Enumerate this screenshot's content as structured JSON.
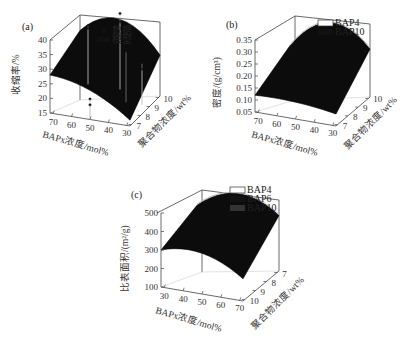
{
  "chart_data": [
    {
      "panel": "(a)",
      "type": "surface3d",
      "zlabel": "收缩率/%",
      "xlabel": "BAPx浓度/mol%",
      "ylabel": "聚合物浓度/wt%",
      "x_ticks": [
        "70",
        "60",
        "50",
        "40",
        "30"
      ],
      "y_ticks": [
        "7",
        "8",
        "9",
        "10"
      ],
      "z_ticks": [
        "15",
        "20",
        "25",
        "30",
        "35",
        "40"
      ],
      "xlim": [
        25,
        75
      ],
      "ylim": [
        7,
        10
      ],
      "zlim": [
        15,
        40
      ],
      "legend": [
        {
          "name": "数据",
          "style": "point"
        },
        {
          "name": "模型",
          "style": "surface"
        }
      ],
      "surface_corners": {
        "x70_y10": 33,
        "x50_y10": 39,
        "x30_y10": 29,
        "x70_y7": 28,
        "x50_y7": 25,
        "x30_y7": 17
      },
      "data_points": [
        {
          "x": 70,
          "y": 10,
          "z": 35
        },
        {
          "x": 70,
          "y": 10,
          "z": 34
        },
        {
          "x": 50,
          "y": 10,
          "z": 41
        },
        {
          "x": 50,
          "y": 10,
          "z": 38
        },
        {
          "x": 40,
          "y": 9,
          "z": 32
        },
        {
          "x": 30,
          "y": 9,
          "z": 29
        },
        {
          "x": 30,
          "y": 9,
          "z": 27
        },
        {
          "x": 50,
          "y": 7,
          "z": 22
        },
        {
          "x": 50,
          "y": 7,
          "z": 20
        }
      ]
    },
    {
      "panel": "(b)",
      "type": "surface3d",
      "zlabel": "密度/(g/cm³)",
      "xlabel": "BAPx浓度/mol%",
      "ylabel": "聚合物浓度/wt%",
      "x_ticks": [
        "70",
        "60",
        "50",
        "40",
        "30"
      ],
      "y_ticks": [
        "7",
        "8",
        "9",
        "10"
      ],
      "z_ticks": [
        "0.05",
        "0.10",
        "0.15",
        "0.20",
        "0.25",
        "0.30",
        "0.35"
      ],
      "xlim": [
        25,
        75
      ],
      "ylim": [
        7,
        10
      ],
      "zlim": [
        0.05,
        0.35
      ],
      "legend": [
        {
          "name": "BAP4",
          "style": "white"
        },
        {
          "name": "BAP10",
          "style": "black"
        }
      ],
      "surface_corners": {
        "x70_y10": 0.2,
        "x50_y10": 0.33,
        "x30_y10": 0.25,
        "x70_y7": 0.12,
        "x50_y7": 0.12,
        "x30_y7": 0.1
      }
    },
    {
      "panel": "(c)",
      "type": "surface3d",
      "zlabel": "比表面积/(m²/g)",
      "xlabel": "BAPx浓度/mol%",
      "ylabel": "聚合物浓度/wt%",
      "x_ticks": [
        "30",
        "40",
        "50",
        "60",
        "70"
      ],
      "y_ticks": [
        "10",
        "9",
        "8",
        "7"
      ],
      "z_ticks": [
        "100",
        "200",
        "300",
        "400",
        "500"
      ],
      "xlim": [
        25,
        75
      ],
      "ylim": [
        7,
        10
      ],
      "zlim": [
        100,
        500
      ],
      "legend": [
        {
          "name": "BAP4",
          "style": "white"
        },
        {
          "name": "BAP6",
          "style": "black"
        },
        {
          "name": "BAP10",
          "style": "dark"
        }
      ],
      "surface_corners": {
        "x30_y10": 380,
        "x50_y10": 480,
        "x70_y10": 400,
        "x30_y7": 300,
        "x50_y7": 320,
        "x70_y7": 220
      }
    }
  ]
}
